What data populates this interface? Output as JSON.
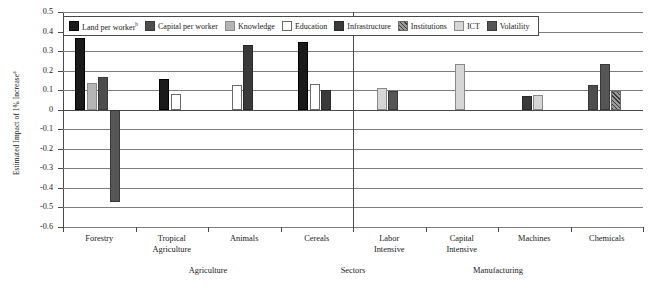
{
  "chart": {
    "type": "bar",
    "ylabel_text": "Estimated Impact of 1% Increase",
    "ylabel_sup": "a",
    "xlabel": "",
    "ylim": [
      -0.6,
      0.5
    ],
    "yticks": [
      "0.5",
      "0.4",
      "0.3",
      "0.2",
      "0.1",
      "0",
      "-0.1",
      "-0.2",
      "-0.3",
      "-0.4",
      "-0.5",
      "-0.6"
    ],
    "ytick_values": [
      0.5,
      0.4,
      0.3,
      0.2,
      0.1,
      0,
      -0.1,
      -0.2,
      -0.3,
      -0.4,
      -0.5,
      -0.6
    ],
    "grid": true,
    "legend_position": "top"
  },
  "legend": {
    "items": [
      {
        "key": "land",
        "label": "Land per worker",
        "sup": "b",
        "color": "#1a1a1a"
      },
      {
        "key": "capital",
        "label": "Capital per worker",
        "sup": "",
        "color": "#4d4d4d"
      },
      {
        "key": "knowledge",
        "label": "Knowledge",
        "sup": "",
        "color": "#b5b5b5"
      },
      {
        "key": "education",
        "label": "Education",
        "sup": "",
        "color": "#ffffff"
      },
      {
        "key": "infrastructure",
        "label": "Infrastructure",
        "sup": "",
        "color": "#3a3a3a"
      },
      {
        "key": "institutions",
        "label": "Institutions",
        "sup": "",
        "color": "#9a9a9a"
      },
      {
        "key": "ict",
        "label": "ICT",
        "sup": "",
        "color": "#d6d6d6"
      },
      {
        "key": "volatility",
        "label": "Volatility",
        "sup": "",
        "color": "#555555"
      }
    ]
  },
  "chart_data": {
    "type": "bar",
    "title": "",
    "xlabel": "",
    "ylabel": "Estimated Impact of 1% Increase",
    "ylim": [
      -0.6,
      0.5
    ],
    "yticks": [
      0.5,
      0.4,
      0.3,
      0.2,
      0.1,
      0,
      -0.1,
      -0.2,
      -0.3,
      -0.4,
      -0.5,
      -0.6
    ],
    "grid": true,
    "legend_position": "top",
    "categories": [
      "Forestry",
      "Tropical Agriculture",
      "Animals",
      "Cereals",
      "Labor Intensive",
      "Capital Intensive",
      "Machines",
      "Chemicals"
    ],
    "panels": [
      {
        "name": "Agriculture",
        "categories": [
          "Forestry",
          "Tropical Agriculture",
          "Animals",
          "Cereals"
        ]
      },
      {
        "name": "Manufacturing",
        "categories": [
          "Labor Intensive",
          "Capital Intensive",
          "Machines",
          "Chemicals"
        ]
      }
    ],
    "panel_axis_label": "Sectors",
    "series": [
      {
        "name": "Land per worker",
        "key": "land",
        "values": [
          0.365,
          0.155,
          null,
          0.348,
          null,
          null,
          null,
          null
        ]
      },
      {
        "name": "Capital per worker",
        "key": "capital",
        "values": [
          0.165,
          null,
          null,
          null,
          null,
          null,
          null,
          0.128
        ]
      },
      {
        "name": "Knowledge",
        "key": "knowledge",
        "values": [
          0.138,
          null,
          null,
          null,
          null,
          null,
          null,
          null
        ]
      },
      {
        "name": "Education",
        "key": "education",
        "values": [
          null,
          0.08,
          0.125,
          0.13,
          null,
          null,
          null,
          null
        ]
      },
      {
        "name": "Infrastructure",
        "key": "infrastructure",
        "values": [
          null,
          null,
          0.33,
          0.1,
          null,
          null,
          0.068,
          null
        ]
      },
      {
        "name": "Institutions",
        "key": "institutions",
        "values": [
          null,
          null,
          null,
          null,
          null,
          null,
          null,
          0.098
        ]
      },
      {
        "name": "ICT",
        "key": "ict",
        "values": [
          null,
          null,
          null,
          null,
          0.113,
          0.235,
          0.075,
          null
        ]
      },
      {
        "name": "Volatility",
        "key": "volatility",
        "values": [
          -0.47,
          null,
          null,
          null,
          0.098,
          null,
          null,
          0.235
        ]
      }
    ],
    "groups": [
      {
        "category": "Forestry",
        "bars": [
          {
            "key": "land",
            "value": 0.365
          },
          {
            "key": "knowledge",
            "value": 0.138
          },
          {
            "key": "capital",
            "value": 0.165
          },
          {
            "key": "volatility",
            "value": -0.47
          }
        ]
      },
      {
        "category": "Tropical Agriculture",
        "bars": [
          {
            "key": "land",
            "value": 0.155
          },
          {
            "key": "education",
            "value": 0.08
          }
        ]
      },
      {
        "category": "Animals",
        "bars": [
          {
            "key": "education",
            "value": 0.125
          },
          {
            "key": "infrastructure",
            "value": 0.33
          }
        ]
      },
      {
        "category": "Cereals",
        "bars": [
          {
            "key": "land",
            "value": 0.348
          },
          {
            "key": "education",
            "value": 0.13
          },
          {
            "key": "infrastructure",
            "value": 0.1
          }
        ]
      },
      {
        "category": "Labor Intensive",
        "bars": [
          {
            "key": "ict",
            "value": 0.113
          },
          {
            "key": "volatility",
            "value": 0.098
          }
        ]
      },
      {
        "category": "Capital Intensive",
        "bars": [
          {
            "key": "ict",
            "value": 0.235
          }
        ]
      },
      {
        "category": "Machines",
        "bars": [
          {
            "key": "infrastructure",
            "value": 0.068
          },
          {
            "key": "ict",
            "value": 0.075
          }
        ]
      },
      {
        "category": "Chemicals",
        "bars": [
          {
            "key": "capital",
            "value": 0.128
          },
          {
            "key": "volatility",
            "value": 0.235
          },
          {
            "key": "institutions",
            "value": 0.098
          }
        ]
      }
    ]
  },
  "xaxis": {
    "labels": [
      {
        "line1": "Forestry",
        "line2": ""
      },
      {
        "line1": "Tropical",
        "line2": "Agriculture"
      },
      {
        "line1": "Animals",
        "line2": ""
      },
      {
        "line1": "Cereals",
        "line2": ""
      },
      {
        "line1": "Labor",
        "line2": "Intensive"
      },
      {
        "line1": "Capital",
        "line2": "Intensive"
      },
      {
        "line1": "Machines",
        "line2": ""
      },
      {
        "line1": "Chemicals",
        "line2": ""
      }
    ],
    "group_labels": [
      "Agriculture",
      "Sectors",
      "Manufacturing"
    ]
  }
}
